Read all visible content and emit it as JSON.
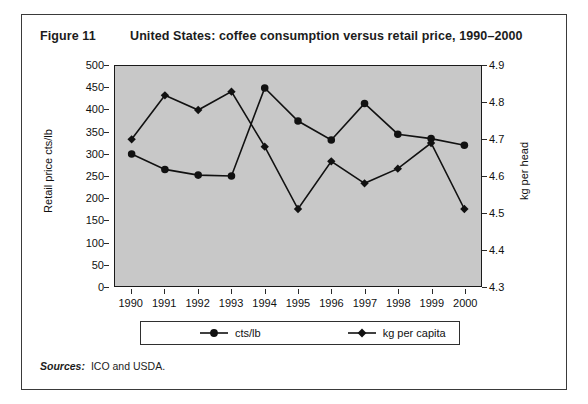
{
  "figure": {
    "number": "Figure 11",
    "title": "United States: coffee consumption versus retail price, 1990–2000"
  },
  "sources": {
    "label": "Sources:",
    "text": "ICO and USDA."
  },
  "colors": {
    "plot_background": "#c8c8c8",
    "series": "#111111",
    "frame": "#3a3a3a",
    "card_background": "#ffffff"
  },
  "chart_data": {
    "type": "line",
    "title": "United States: coffee consumption versus retail price, 1990–2000",
    "xlabel": "",
    "ylabel": "Retail price cts/lb",
    "y2label": "kg per head",
    "grid": false,
    "legend_position": "bottom",
    "categories": [
      "1990",
      "1991",
      "1992",
      "1993",
      "1994",
      "1995",
      "1996",
      "1997",
      "1998",
      "1999",
      "2000"
    ],
    "x_tick_labels": [
      "1990",
      "1991",
      "1992",
      "1993",
      "1994",
      "1995",
      "1996",
      "1997",
      "1998",
      "1999",
      "2000"
    ],
    "ylim": [
      0,
      500
    ],
    "y_tick_labels": [
      "500",
      "450",
      "400",
      "350",
      "300",
      "250",
      "200",
      "150",
      "100",
      "50",
      "0"
    ],
    "y_ticks": [
      500,
      450,
      400,
      350,
      300,
      250,
      200,
      150,
      100,
      50,
      0
    ],
    "y2lim": [
      4.3,
      4.9
    ],
    "y2_tick_labels": [
      "4.9",
      "4.8",
      "4.7",
      "4.6",
      "4.5",
      "4.4",
      "4.3"
    ],
    "y2_ticks": [
      4.9,
      4.8,
      4.7,
      4.6,
      4.5,
      4.4,
      4.3
    ],
    "series": [
      {
        "name": "cts/lb",
        "axis": "left",
        "marker": "circle",
        "values": [
          300,
          265,
          252,
          250,
          450,
          375,
          332,
          415,
          345,
          335,
          320
        ]
      },
      {
        "name": "kg per capita",
        "axis": "right",
        "marker": "diamond",
        "values": [
          4.7,
          4.82,
          4.78,
          4.83,
          4.68,
          4.51,
          4.64,
          4.58,
          4.62,
          4.69,
          4.51
        ]
      }
    ]
  }
}
